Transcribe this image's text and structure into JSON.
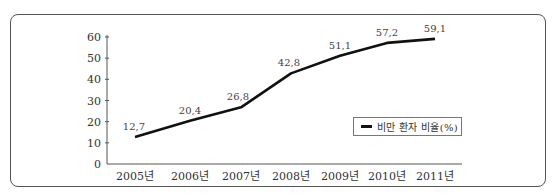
{
  "chart_data": {
    "type": "line",
    "title": "",
    "xlabel": "",
    "ylabel": "",
    "categories": [
      "2005년",
      "2006년",
      "2007년",
      "2008년",
      "2009년",
      "2010년",
      "2011년"
    ],
    "series": [
      {
        "name": "비만 환자 비율(%)",
        "values": [
          12.7,
          20.4,
          26.8,
          42.8,
          51.1,
          57.2,
          59.1
        ],
        "data_labels": [
          "12,7",
          "20,4",
          "26,8",
          "42,8",
          "51,1",
          "57,2",
          "59,1"
        ],
        "color": "#111111"
      }
    ],
    "ylim": [
      0,
      60
    ],
    "yticks": [
      0,
      10,
      20,
      30,
      40,
      50,
      60
    ],
    "ytick_labels": [
      "0",
      "10",
      "20",
      "30",
      "40",
      "50",
      "60"
    ],
    "grid": false,
    "legend_position": "inside-right"
  },
  "legend": {
    "label": "비만 환자 비율(%)"
  }
}
